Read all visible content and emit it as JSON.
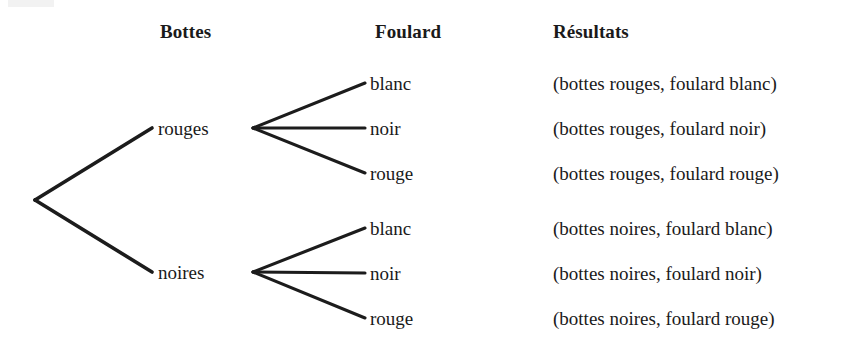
{
  "figure": {
    "kind": "probability-tree-diagram",
    "language": "fr",
    "background_color": "#ffffff",
    "ink_color": "#1c1c1c"
  },
  "headers": {
    "level1": "Bottes",
    "level2": "Foulard",
    "outcomes": "Résultats"
  },
  "tree": {
    "root": {
      "x": 35,
      "y": 200
    },
    "level1_nodes": [
      {
        "label": "rouges",
        "label_x": 158,
        "node_y": 128,
        "line_end_x": 152,
        "vertex_x": 253,
        "children": [
          {
            "label": "blanc",
            "y": 83
          },
          {
            "label": "noir",
            "y": 128
          },
          {
            "label": "rouge",
            "y": 173
          }
        ]
      },
      {
        "label": "noires",
        "label_x": 158,
        "node_y": 272,
        "line_end_x": 152,
        "vertex_x": 253,
        "children": [
          {
            "label": "blanc",
            "y": 228
          },
          {
            "label": "noir",
            "y": 273
          },
          {
            "label": "rouge",
            "y": 318
          }
        ]
      }
    ],
    "leaf_label_x": 370,
    "leaf_line_end_x": 365
  },
  "outcomes": [
    {
      "text": "(bottes rouges, foulard blanc)",
      "y": 83
    },
    {
      "text": "(bottes rouges, foulard noir)",
      "y": 128
    },
    {
      "text": "(bottes rouges, foulard rouge)",
      "y": 173
    },
    {
      "text": "(bottes noires, foulard blanc)",
      "y": 228
    },
    {
      "text": "(bottes noires, foulard noir)",
      "y": 273
    },
    {
      "text": "(bottes noires, foulard rouge)",
      "y": 318
    }
  ],
  "layout": {
    "header_y": 22,
    "header_bottes_x": 160,
    "header_foulard_x": 375,
    "header_resultats_x": 553,
    "outcomes_x": 553
  }
}
